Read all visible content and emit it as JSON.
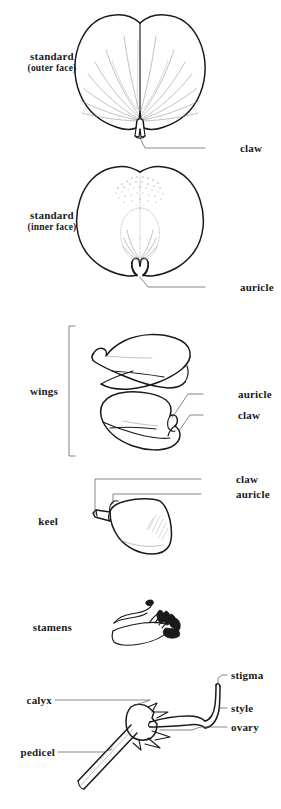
{
  "figure": {
    "kind": "botanical-line-diagram",
    "ink_color": "#1a1a1a",
    "background_color": "#ffffff",
    "stipple_color": "#4a4a4a",
    "leader_color": "#555555"
  },
  "sections": [
    {
      "id": "standard-outer",
      "title_line1": "standard",
      "title_line2": "(outer face)",
      "callouts": [
        {
          "label": "claw"
        }
      ]
    },
    {
      "id": "standard-inner",
      "title_line1": "standard",
      "title_line2": "(inner face)",
      "callouts": [
        {
          "label": "auricle"
        }
      ]
    },
    {
      "id": "wings",
      "title_line1": "wings",
      "title_line2": "",
      "callouts": [
        {
          "label": "auricle"
        },
        {
          "label": "claw"
        }
      ]
    },
    {
      "id": "keel",
      "title_line1": "keel",
      "title_line2": "",
      "callouts": [
        {
          "label": "claw"
        },
        {
          "label": "auricle"
        }
      ]
    },
    {
      "id": "stamens",
      "title_line1": "stamens",
      "title_line2": "",
      "callouts": []
    },
    {
      "id": "pistil",
      "title_line1": "",
      "title_line2": "",
      "callouts": [
        {
          "label": "stigma"
        },
        {
          "label": "style"
        },
        {
          "label": "ovary"
        },
        {
          "label": "calyx"
        },
        {
          "label": "pedicel"
        }
      ]
    }
  ],
  "labels": {
    "standard_outer_l1": "standard",
    "standard_outer_l2": "(outer face)",
    "standard_inner_l1": "standard",
    "standard_inner_l2": "(inner face)",
    "wings": "wings",
    "keel": "keel",
    "stamens": "stamens",
    "claw_standard": "claw",
    "auricle_standard": "auricle",
    "auricle_wings": "auricle",
    "claw_wings": "claw",
    "claw_keel": "claw",
    "auricle_keel": "auricle",
    "stigma": "stigma",
    "style": "style",
    "ovary": "ovary",
    "calyx": "calyx",
    "pedicel": "pedicel"
  }
}
